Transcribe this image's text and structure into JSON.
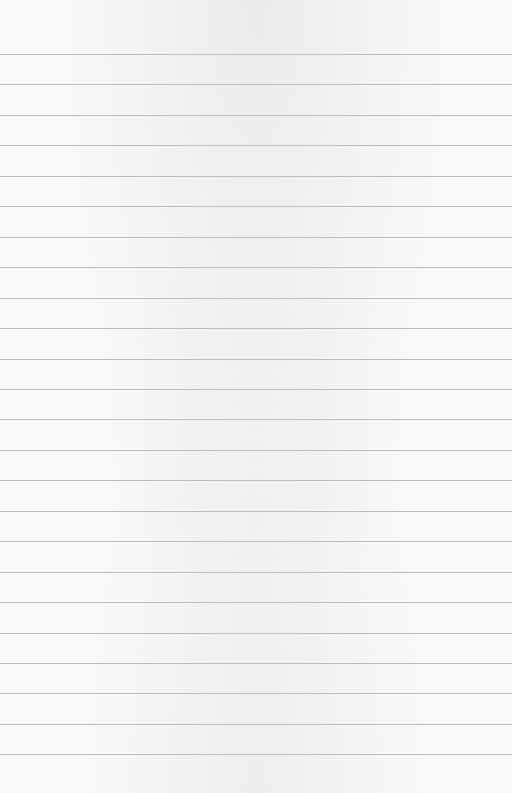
{
  "paper": {
    "type": "lined-paper",
    "background_color": "#fafaf9",
    "rule_color": "#bdbdbd",
    "first_rule_y": 54,
    "rule_spacing": 30.45,
    "rule_count": 24,
    "text": ""
  }
}
